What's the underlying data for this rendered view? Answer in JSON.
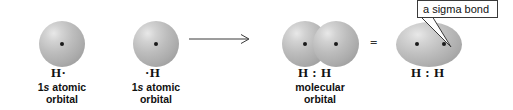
{
  "figure": {
    "background_color": "#ffffff",
    "orbital_color": "#b0b0b0",
    "nucleus_color": "#1a1a1a",
    "line_color": "#3a3a3a"
  },
  "atoms": [
    {
      "id": "left-hydrogen",
      "symbol": "H·",
      "caption_line1_prefix": "1",
      "caption_line1_italic": "s",
      "caption_line1_suffix": " atomic",
      "caption_line2": "orbital"
    },
    {
      "id": "right-hydrogen",
      "symbol": "·H",
      "caption_line1_prefix": "1",
      "caption_line1_italic": "s",
      "caption_line1_suffix": " atomic",
      "caption_line2": "orbital"
    }
  ],
  "reaction_arrow": {
    "symbol": "arrow-right",
    "label": ""
  },
  "products": [
    {
      "id": "overlapping-orbitals",
      "symbol": "H : H",
      "caption_line1": "molecular",
      "caption_line2": "orbital"
    },
    {
      "id": "merged-orbital",
      "symbol": "H : H",
      "caption_line1": "",
      "caption_line2": ""
    }
  ],
  "equals_sign": "=",
  "callout": {
    "text": "a sigma bond",
    "border_color": "#3a3a3a"
  }
}
